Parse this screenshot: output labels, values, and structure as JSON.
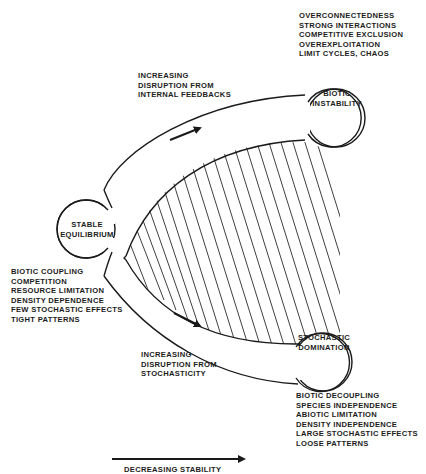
{
  "diagram": {
    "colors": {
      "stroke": "#1a1a1a",
      "background": "#ffffff",
      "hatch": "#2a2a2a"
    },
    "nodes": {
      "stable": {
        "lines": [
          "STABLE",
          "EQUILIBRIUM"
        ]
      },
      "biotic_instability": {
        "lines": [
          "BIOTIC",
          "INSTABILITY"
        ]
      },
      "stochastic_domination": {
        "lines": [
          "STOCHASTIC",
          "DOMINATION"
        ]
      }
    },
    "upper_path_label": {
      "lines": [
        "INCREASING",
        "DISRUPTION FROM",
        "INTERNAL FEEDBACKS"
      ]
    },
    "lower_path_label": {
      "lines": [
        "INCREASING",
        "DISRUPTION FROM",
        "STOCHASTICITY"
      ]
    },
    "biotic_instability_traits": [
      "OVERCONNECTEDNESS",
      "STRONG INTERACTIONS",
      "COMPETITIVE EXCLUSION",
      "OVEREXPLOITATION",
      "LIMIT CYCLES, CHAOS"
    ],
    "stable_traits": [
      "BIOTIC COUPLING",
      "COMPETITION",
      "RESOURCE LIMITATION",
      "DENSITY DEPENDENCE",
      "FEW STOCHASTIC EFFECTS",
      "TIGHT PATTERNS"
    ],
    "stochastic_traits": [
      "BIOTIC DECOUPLING",
      "SPECIES INDEPENDENCE",
      "ABIOTIC LIMITATION",
      "DENSITY INDEPENDENCE",
      "LARGE STOCHASTIC EFFECTS",
      "LOOSE PATTERNS"
    ],
    "axis": {
      "label": "DECREASING STABILITY"
    }
  }
}
